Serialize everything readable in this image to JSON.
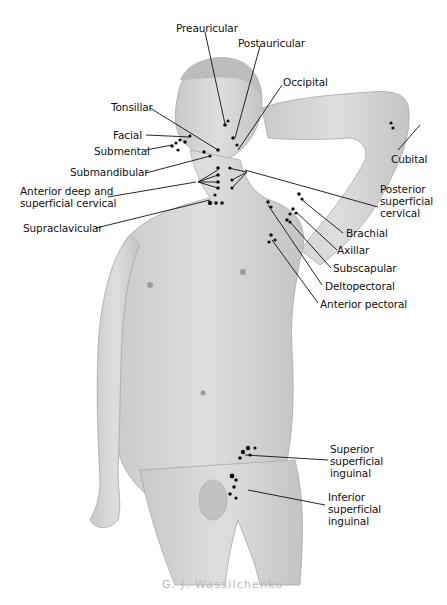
{
  "figure": {
    "artist_signature": "G. J. Wassilchenko",
    "colors": {
      "background": "#ffffff",
      "skin": "#d6d6d6",
      "skin_shadow": "#b5b5b5",
      "node": "#111111",
      "leader_line": "#111111",
      "text": "#111111",
      "signature": "#b9b9b9"
    }
  },
  "labels": {
    "preauricular": "Preauricular",
    "postauricular": "Postauricular",
    "occipital": "Occipital",
    "tonsillar": "Tonsillar",
    "facial": "Facial",
    "submental": "Submental",
    "submandibular": "Submandibular",
    "anterior_cervical": [
      "Anterior deep and",
      "superficial cervical"
    ],
    "supraclavicular": "Supraclavicular",
    "cubital": "Cubital",
    "posterior_cervical": [
      "Posterior",
      "superficial",
      "cervical"
    ],
    "brachial": "Brachial",
    "axillar": "Axillar",
    "subscapular": "Subscapular",
    "deltopectoral": "Deltopectoral",
    "anterior_pectoral": "Anterior pectoral",
    "superior_inguinal": [
      "Superior",
      "superficial",
      "inguinal"
    ],
    "inferior_inguinal": [
      "Inferior",
      "superficial",
      "inguinal"
    ]
  }
}
